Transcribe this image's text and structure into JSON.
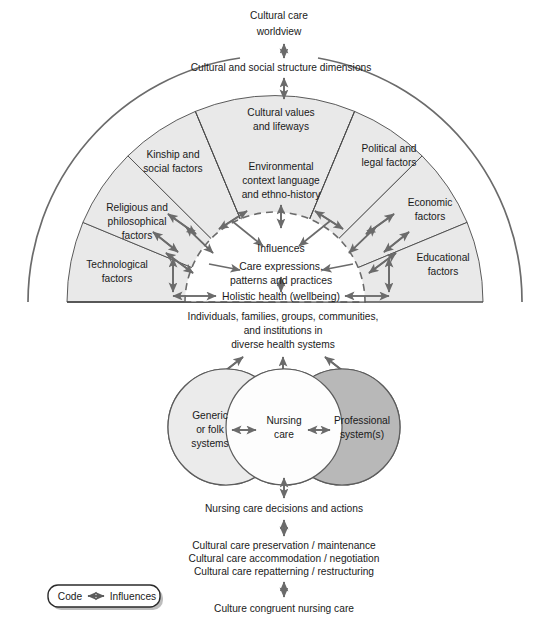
{
  "top": {
    "worldview": [
      "Cultural care",
      "worldview"
    ],
    "dimensions": "Cultural and social structure dimensions"
  },
  "sectors": [
    {
      "id": "technological",
      "lines": [
        "Technological",
        "factors"
      ]
    },
    {
      "id": "religious",
      "lines": [
        "Religious and",
        "philosophical",
        "factors"
      ]
    },
    {
      "id": "kinship",
      "lines": [
        "Kinship and",
        "social factors"
      ]
    },
    {
      "id": "cultural-values",
      "lines": [
        "Cultural values",
        "and lifeways"
      ]
    },
    {
      "id": "political",
      "lines": [
        "Political and",
        "legal factors"
      ]
    },
    {
      "id": "economic",
      "lines": [
        "Economic",
        "factors"
      ]
    },
    {
      "id": "educational",
      "lines": [
        "Educational",
        "factors"
      ]
    }
  ],
  "center_sector": {
    "id": "environmental",
    "lines": [
      "Environmental",
      "context language",
      "and ethno-history"
    ]
  },
  "core": {
    "influences": "Influences",
    "care_expressions": [
      "Care expressions,",
      "patterns and practices"
    ],
    "holistic": "Holistic health (wellbeing)"
  },
  "mid": {
    "people": [
      "Individuals, families, groups, communities,",
      "and institutions in",
      "diverse health systems"
    ],
    "circles": [
      {
        "id": "generic-folk",
        "lines": [
          "Generic",
          "or folk",
          "systems"
        ]
      },
      {
        "id": "nursing-care",
        "lines": [
          "Nursing",
          "care"
        ]
      },
      {
        "id": "professional-system",
        "lines": [
          "Professional",
          "system(s)"
        ]
      }
    ]
  },
  "bottom": {
    "decisions": "Nursing care decisions and actions",
    "modes": [
      "Cultural care preservation / maintenance",
      "Cultural care accommodation / negotiation",
      "Cultural care repatterning / restructuring"
    ],
    "outcome": "Culture congruent nursing care"
  },
  "legend": {
    "code_label": "Code",
    "influences_label": "Influences"
  },
  "colors": {
    "sector_fill": "#e9e9e9",
    "core_fill": "#ffffff",
    "circle_left": "#ebebeb",
    "circle_mid": "#fdfdfd",
    "circle_right": "#b8b8b8",
    "stroke": "#5c5c5c",
    "text": "#1a1a1a"
  }
}
